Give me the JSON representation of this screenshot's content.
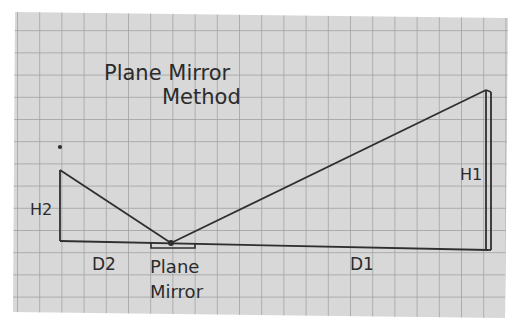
{
  "title": {
    "line1": "Plane Mirror",
    "line2": "Method"
  },
  "labels": {
    "h2": "H2",
    "d2": "D2",
    "h1": "H1",
    "d1": "D1",
    "mirror_line1": "Plane",
    "mirror_line2": "Mirror"
  },
  "colors": {
    "paper": "#d7d7d7",
    "grid": "#9a9a9a",
    "ink": "#2b2b2b",
    "background": "#ffffff"
  }
}
